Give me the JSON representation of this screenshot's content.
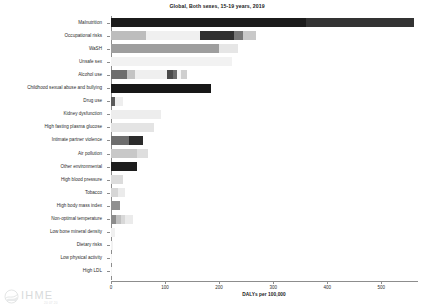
{
  "chart_data": {
    "type": "bar",
    "orientation": "horizontal",
    "stacked": true,
    "title": "Global, Both sexes, 15-19 years, 2019",
    "xlabel": "DALYs per 100,000",
    "ylabel": "",
    "xlim": [
      0,
      566
    ],
    "xticks": [
      0,
      100,
      200,
      300,
      400,
      500
    ],
    "xticklabels": [
      "0",
      "100",
      "200",
      "300",
      "400",
      "500"
    ],
    "grid": false,
    "legend": "none",
    "categories": [
      "Malnutrition",
      "Occupational risks",
      "WaSH",
      "Unsafe sex",
      "Alcohol use",
      "Childhood sexual abuse and bullying",
      "Drug use",
      "Kidney dysfunction",
      "High fasting plasma glucose",
      "Intimate partner violence",
      "Air pollution",
      "Other environmental",
      "High blood pressure",
      "Tobacco",
      "High body mass index",
      "Non-optimal temperature",
      "Low bone mineral density",
      "Dietary risks",
      "Low physical activity",
      "High LDL"
    ],
    "values": [
      560,
      268,
      234,
      223,
      140,
      185,
      22,
      92,
      79,
      59,
      68,
      48,
      22,
      25,
      16,
      40,
      8,
      3,
      2,
      1
    ],
    "bars": [
      {
        "category": "Malnutrition",
        "total": 560,
        "segments": [
          {
            "value": 360,
            "color": "#1b1b1b"
          },
          {
            "value": 200,
            "color": "#333333"
          }
        ]
      },
      {
        "category": "Occupational risks",
        "total": 268,
        "segments": [
          {
            "value": 65,
            "color": "#bdbdbd"
          },
          {
            "value": 100,
            "color": "#f0f0f0"
          },
          {
            "value": 63,
            "color": "#303030"
          },
          {
            "value": 16,
            "color": "#777777"
          },
          {
            "value": 24,
            "color": "#c9c9c9"
          }
        ]
      },
      {
        "category": "WaSH",
        "total": 234,
        "segments": [
          {
            "value": 199,
            "color": "#9e9e9e"
          },
          {
            "value": 35,
            "color": "#e6e6e6"
          }
        ]
      },
      {
        "category": "Unsafe sex",
        "total": 223,
        "segments": [
          {
            "value": 223,
            "color": "#f2f2f2"
          }
        ]
      },
      {
        "category": "Alcohol use",
        "total": 140,
        "segments": [
          {
            "value": 30,
            "color": "#6e6e6e"
          },
          {
            "value": 14,
            "color": "#c4c4c4"
          },
          {
            "value": 60,
            "color": "#efefef"
          },
          {
            "value": 10,
            "color": "#4a4a4a"
          },
          {
            "value": 9,
            "color": "#6a6a6a"
          },
          {
            "value": 6,
            "color": "#f4f4f4"
          },
          {
            "value": 11,
            "color": "#cfcfcf"
          }
        ]
      },
      {
        "category": "Childhood sexual abuse and bullying",
        "total": 185,
        "segments": [
          {
            "value": 185,
            "color": "#171717"
          }
        ]
      },
      {
        "category": "Drug use",
        "total": 22,
        "segments": [
          {
            "value": 8,
            "color": "#5a5a5a"
          },
          {
            "value": 14,
            "color": "#eeeeee"
          }
        ]
      },
      {
        "category": "Kidney dysfunction",
        "total": 92,
        "segments": [
          {
            "value": 92,
            "color": "#ededed"
          }
        ]
      },
      {
        "category": "High fasting plasma glucose",
        "total": 79,
        "segments": [
          {
            "value": 79,
            "color": "#e4e4e4"
          }
        ]
      },
      {
        "category": "Intimate partner violence",
        "total": 59,
        "segments": [
          {
            "value": 33,
            "color": "#6d6d6d"
          },
          {
            "value": 26,
            "color": "#2b2b2b"
          }
        ]
      },
      {
        "category": "Air pollution",
        "total": 68,
        "segments": [
          {
            "value": 48,
            "color": "#c8c8c8"
          },
          {
            "value": 20,
            "color": "#dedede"
          }
        ]
      },
      {
        "category": "Other environmental",
        "total": 48,
        "segments": [
          {
            "value": 48,
            "color": "#1d1d1d"
          }
        ]
      },
      {
        "category": "High blood pressure",
        "total": 22,
        "segments": [
          {
            "value": 22,
            "color": "#dcdcdc"
          }
        ]
      },
      {
        "category": "Tobacco",
        "total": 25,
        "segments": [
          {
            "value": 13,
            "color": "#d6d6d6"
          },
          {
            "value": 12,
            "color": "#ebebeb"
          }
        ]
      },
      {
        "category": "High body mass index",
        "total": 16,
        "segments": [
          {
            "value": 16,
            "color": "#8f8f8f"
          }
        ]
      },
      {
        "category": "Non-optimal temperature",
        "total": 40,
        "segments": [
          {
            "value": 10,
            "color": "#8c8c8c"
          },
          {
            "value": 8,
            "color": "#c0c0c0"
          },
          {
            "value": 8,
            "color": "#d8d8d8"
          },
          {
            "value": 14,
            "color": "#ebebeb"
          }
        ]
      },
      {
        "category": "Low bone mineral density",
        "total": 8,
        "segments": [
          {
            "value": 8,
            "color": "#f0f0f0"
          }
        ]
      },
      {
        "category": "Dietary risks",
        "total": 3,
        "segments": [
          {
            "value": 3,
            "color": "#f2f2f2"
          }
        ]
      },
      {
        "category": "Low physical activity",
        "total": 2,
        "segments": [
          {
            "value": 2,
            "color": "#f4f4f4"
          }
        ]
      },
      {
        "category": "High LDL",
        "total": 1,
        "segments": [
          {
            "value": 1,
            "color": "#f5f5f5"
          }
        ]
      }
    ]
  },
  "watermark": {
    "name": "IHME",
    "subtext": "20 07 20",
    "icon": "ihme-globe-icon"
  }
}
